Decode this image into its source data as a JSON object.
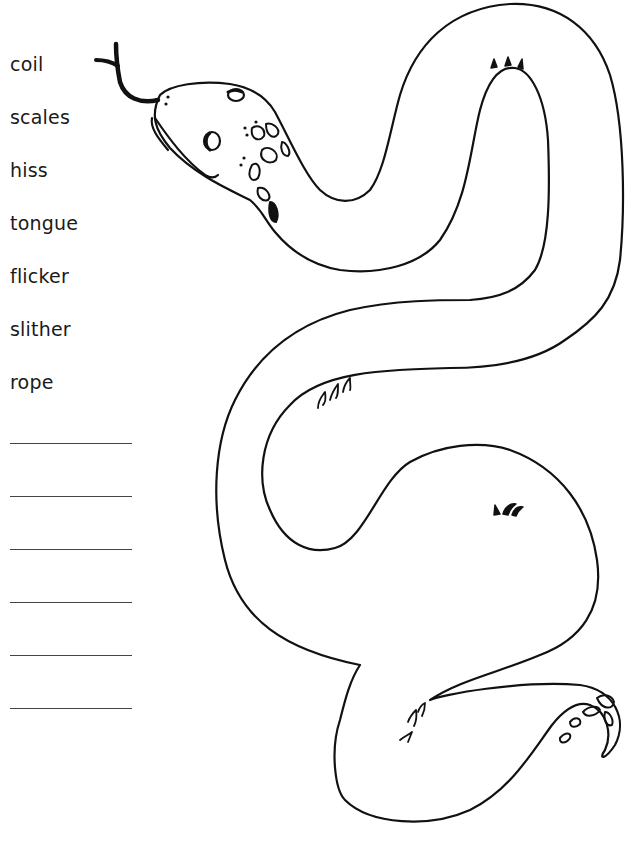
{
  "worksheet": {
    "word_bank": [
      "coil",
      "scales",
      "hiss",
      "tongue",
      "flicker",
      "slither",
      "rope"
    ],
    "answer_line_count": 6,
    "answer_lines": [
      "",
      "",
      "",
      "",
      "",
      ""
    ],
    "illustration": {
      "subject": "snake-outline",
      "stroke_color": "#111111",
      "fill_color": "#ffffff"
    }
  }
}
